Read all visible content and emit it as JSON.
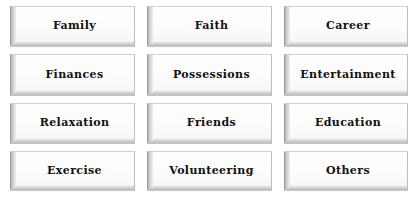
{
  "tiles": [
    {
      "label": "Family"
    },
    {
      "label": "Faith"
    },
    {
      "label": "Career"
    },
    {
      "label": "Finances"
    },
    {
      "label": "Possessions"
    },
    {
      "label": "Entertainment"
    },
    {
      "label": "Relaxation"
    },
    {
      "label": "Friends"
    },
    {
      "label": "Education"
    },
    {
      "label": "Exercise"
    },
    {
      "label": "Volunteering"
    },
    {
      "label": "Others"
    }
  ]
}
